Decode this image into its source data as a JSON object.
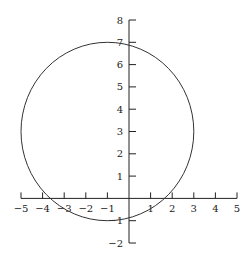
{
  "chart_data": {
    "type": "line",
    "title": "",
    "xlabel": "",
    "ylabel": "",
    "xlim": [
      -5,
      5
    ],
    "ylim": [
      -2,
      8
    ],
    "x_ticks": [
      -5,
      -4,
      -3,
      -2,
      -1,
      1,
      2,
      3,
      4,
      5
    ],
    "x_tick_labels": [
      "−5",
      "−4",
      "−3",
      "−2",
      "−1",
      "1",
      "2",
      "3",
      "4",
      "5"
    ],
    "y_ticks": [
      -2,
      -1,
      1,
      2,
      3,
      4,
      5,
      6,
      7,
      8
    ],
    "y_tick_labels": [
      "−2",
      "−1",
      "1",
      "2",
      "3",
      "4",
      "5",
      "6",
      "7",
      "8"
    ],
    "grid": false,
    "legend": "none",
    "series": [
      {
        "name": "circle",
        "shape": "circle",
        "center": [
          -1,
          3
        ],
        "radius": 4,
        "equation": "(x+1)^2 + (y-3)^2 = 16"
      }
    ]
  }
}
